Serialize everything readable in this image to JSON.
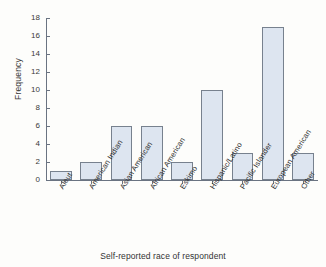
{
  "chart_data": {
    "type": "bar",
    "title": "",
    "xlabel": "Self-reported race of respondent",
    "ylabel": "Frequency",
    "categories": [
      "Aleut",
      "American Indian",
      "Asian American",
      "African American",
      "Eskimo",
      "Hispanic/Latino",
      "Pacific Islander",
      "European American",
      "Other"
    ],
    "values": [
      1,
      2,
      6,
      6,
      2,
      10,
      3,
      17,
      3
    ],
    "ylim": [
      0,
      18
    ],
    "ytick_labels": [
      "0",
      "2",
      "4",
      "6",
      "8",
      "10",
      "12",
      "14",
      "16",
      "18"
    ],
    "ytick_values": [
      0,
      2,
      4,
      6,
      8,
      10,
      12,
      14,
      16,
      18
    ],
    "grid": false,
    "legend": false,
    "bar_fill_color": "#dde5f0",
    "bar_edge_color": "#77818e",
    "axis_color": "#6a7381",
    "background_color": "#fdfdfb"
  }
}
